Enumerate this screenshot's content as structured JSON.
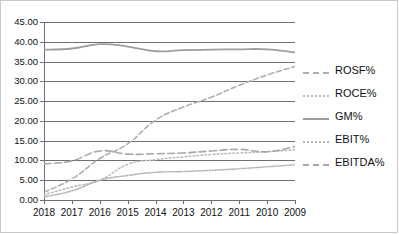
{
  "chart_data": {
    "type": "line",
    "title": "",
    "subtitle": "",
    "xlabel": "",
    "ylabel": "",
    "grid": true,
    "legend_position": "right",
    "categories": [
      "2018",
      "2017",
      "2016",
      "2015",
      "2014",
      "2013",
      "2012",
      "2011",
      "2010",
      "2009"
    ],
    "x_tick_labels": [
      "2018",
      "2017",
      "2016",
      "2015",
      "2014",
      "2013",
      "2012",
      "2011",
      "2010",
      "2009"
    ],
    "y_tick_labels": [
      "0.00",
      "5.00",
      "10.00",
      "15.00",
      "20.00",
      "25.00",
      "30.00",
      "35.00",
      "40.00",
      "45.00"
    ],
    "y_tick_values": [
      0,
      5,
      10,
      15,
      20,
      25,
      30,
      35,
      40,
      45
    ],
    "ylim": [
      0,
      45
    ],
    "series": [
      {
        "name": "ROSF%",
        "style": "dashed",
        "color": "#aeaeae",
        "values": [
          2.0,
          5.3,
          10.5,
          14.2,
          20.2,
          23.5,
          26.0,
          29.0,
          31.6,
          33.8
        ]
      },
      {
        "name": "ROCE%",
        "style": "dotted",
        "color": "#bdbdbd",
        "values": [
          1.3,
          3.3,
          5.0,
          9.0,
          10.2,
          10.9,
          11.5,
          11.9,
          12.2,
          12.7
        ]
      },
      {
        "name": "GM%",
        "style": "solid",
        "color": "#9e9e9e",
        "values": [
          38.0,
          38.3,
          39.4,
          38.8,
          37.6,
          37.9,
          38.0,
          38.1,
          38.1,
          37.3
        ]
      },
      {
        "name": "EBIT%",
        "style": "fine-dotted",
        "color": "#b5b5b5",
        "values": [
          0.8,
          2.3,
          5.0,
          6.2,
          7.0,
          7.2,
          7.5,
          7.9,
          8.4,
          8.9
        ]
      },
      {
        "name": "EBITDA%",
        "style": "dash-dash",
        "color": "#a8a8a8",
        "values": [
          9.1,
          9.9,
          12.4,
          11.6,
          11.7,
          11.9,
          12.4,
          12.8,
          12.2,
          13.5
        ]
      }
    ]
  },
  "legend": {
    "items": [
      {
        "label": "ROSF%",
        "key": "k-dash"
      },
      {
        "label": "ROCE%",
        "key": "k-dot"
      },
      {
        "label": "GM%",
        "key": "k-solid"
      },
      {
        "label": "EBIT%",
        "key": "k-finedot"
      },
      {
        "label": "EBITDA%",
        "key": "k-dashdash"
      }
    ]
  }
}
